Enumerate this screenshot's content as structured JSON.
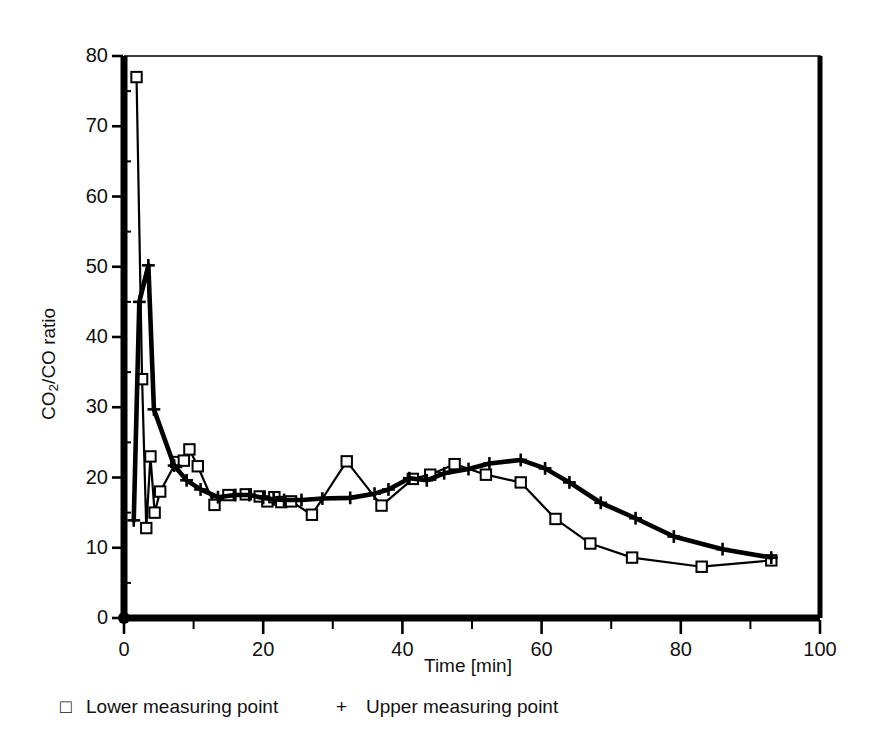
{
  "figure": {
    "background": "#ffffff",
    "ink_color": "#000000"
  },
  "axes": {
    "y_label_prefix": "CO",
    "y_label_sub": "2",
    "y_label_suffix": "/CO  ratio",
    "y_label_plain": "CO2/CO ratio",
    "x_label": "Time [min]",
    "y_ticks": [
      "0",
      "10",
      "20",
      "30",
      "40",
      "50",
      "60",
      "70",
      "80"
    ],
    "x_ticks": [
      "0",
      "20",
      "40",
      "60",
      "80",
      "100"
    ],
    "x_minor_ticks": [
      "10",
      "30",
      "50",
      "70",
      "90"
    ]
  },
  "legend": {
    "position": "below-axes",
    "entries": [
      {
        "marker": "square-open-marker",
        "marker_glyph": "□",
        "label": "Lower measuring point"
      },
      {
        "marker": "plus-marker",
        "marker_glyph": "+",
        "label": "Upper measuring point"
      }
    ]
  },
  "chart_data": {
    "type": "line",
    "title": "",
    "xlabel": "Time [min]",
    "ylabel": "CO2/CO ratio",
    "xlim": [
      0,
      100
    ],
    "ylim": [
      0,
      80
    ],
    "grid": false,
    "legend_position": "below",
    "x_major_tick_step": 20,
    "x_minor_tick_step": 10,
    "y_major_tick_step": 10,
    "series": [
      {
        "name": "Lower measuring point",
        "marker": "square-open-marker",
        "line_width": "thin",
        "color": "#000000",
        "points": [
          [
            1.8,
            77.0
          ],
          [
            2.6,
            34.0
          ],
          [
            3.2,
            12.8
          ],
          [
            3.8,
            23.0
          ],
          [
            4.4,
            15.0
          ],
          [
            5.2,
            18.0
          ],
          [
            7.5,
            22.2
          ],
          [
            8.6,
            22.4
          ],
          [
            9.4,
            24.0
          ],
          [
            10.6,
            21.6
          ],
          [
            13.0,
            16.1
          ],
          [
            15.0,
            17.5
          ],
          [
            17.5,
            17.6
          ],
          [
            19.5,
            17.3
          ],
          [
            20.6,
            16.6
          ],
          [
            21.6,
            17.2
          ],
          [
            22.6,
            16.5
          ],
          [
            24.0,
            16.6
          ],
          [
            27.0,
            14.7
          ],
          [
            32.0,
            22.3
          ],
          [
            37.0,
            16.0
          ],
          [
            41.5,
            19.8
          ],
          [
            44.0,
            20.4
          ],
          [
            47.5,
            21.9
          ],
          [
            52.0,
            20.4
          ],
          [
            57.0,
            19.3
          ],
          [
            62.0,
            14.1
          ],
          [
            67.0,
            10.6
          ],
          [
            73.0,
            8.6
          ],
          [
            83.0,
            7.3
          ],
          [
            93.0,
            8.2
          ]
        ]
      },
      {
        "name": "Upper measuring point",
        "marker": "plus-marker",
        "line_width": "thick",
        "color": "#000000",
        "points": [
          [
            1.4,
            13.9
          ],
          [
            2.2,
            45.0
          ],
          [
            3.5,
            50.2
          ],
          [
            4.3,
            29.7
          ],
          [
            7.2,
            21.7
          ],
          [
            9.0,
            19.6
          ],
          [
            11.0,
            18.3
          ],
          [
            13.5,
            17.2
          ],
          [
            16.0,
            17.5
          ],
          [
            18.0,
            17.5
          ],
          [
            20.0,
            17.1
          ],
          [
            21.5,
            16.9
          ],
          [
            23.0,
            16.8
          ],
          [
            25.5,
            16.8
          ],
          [
            28.5,
            17.0
          ],
          [
            32.5,
            17.1
          ],
          [
            36.0,
            17.7
          ],
          [
            38.0,
            18.3
          ],
          [
            41.0,
            19.9
          ],
          [
            43.5,
            19.6
          ],
          [
            46.0,
            20.6
          ],
          [
            49.5,
            21.2
          ],
          [
            52.5,
            22.0
          ],
          [
            57.0,
            22.5
          ],
          [
            60.5,
            21.3
          ],
          [
            64.0,
            19.3
          ],
          [
            68.5,
            16.4
          ],
          [
            73.5,
            14.2
          ],
          [
            79.0,
            11.6
          ],
          [
            86.0,
            9.8
          ],
          [
            93.0,
            8.6
          ]
        ]
      }
    ]
  }
}
